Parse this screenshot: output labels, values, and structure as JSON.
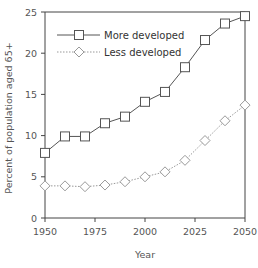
{
  "chart_data": {
    "type": "line",
    "title": "",
    "xlabel": "Year",
    "ylabel": "Percent of population aged 65+",
    "xlim": [
      1950,
      2050
    ],
    "ylim": [
      0,
      25
    ],
    "x_ticks": [
      1950,
      1975,
      2000,
      2025,
      2050
    ],
    "y_ticks": [
      0,
      5,
      10,
      15,
      20,
      25
    ],
    "grid": false,
    "legend_position": "upper-left",
    "x": [
      1950,
      1960,
      1970,
      1980,
      1990,
      2000,
      2010,
      2020,
      2030,
      2040,
      2050
    ],
    "series": [
      {
        "name": "More developed",
        "marker": "square",
        "line_style": "solid",
        "color": "#555555",
        "values": [
          7.9,
          9.9,
          9.9,
          11.5,
          12.3,
          14.1,
          15.3,
          18.3,
          21.6,
          23.6,
          24.5
        ]
      },
      {
        "name": "Less developed",
        "marker": "diamond",
        "line_style": "dotted",
        "color": "#999999",
        "values": [
          3.9,
          3.9,
          3.8,
          4.0,
          4.4,
          5.0,
          5.6,
          7.0,
          9.4,
          11.8,
          13.7
        ]
      }
    ]
  }
}
